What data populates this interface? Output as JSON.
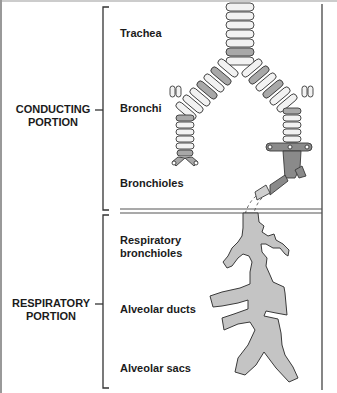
{
  "portions": [
    {
      "id": "conducting",
      "line1": "CONDUCTING",
      "line2": "PORTION"
    },
    {
      "id": "respiratory",
      "line1": "RESPIRATORY",
      "line2": "PORTION"
    }
  ],
  "structures": {
    "trachea": "Trachea",
    "bronchi": "Bronchi",
    "bronchioles": "Bronchioles",
    "respiratory_bronchioles_line1": "Respiratory",
    "respiratory_bronchioles_line2": "bronchioles",
    "alveolar_ducts": "Alveolar ducts",
    "alveolar_sacs": "Alveolar sacs"
  },
  "colors": {
    "ring_light": "#f2f2f2",
    "ring_dark": "#a8a8a8",
    "bronchiole_dark": "#8a8a8a",
    "alveoli_fill": "#c4c4c4",
    "outline": "#3a3a3a"
  }
}
